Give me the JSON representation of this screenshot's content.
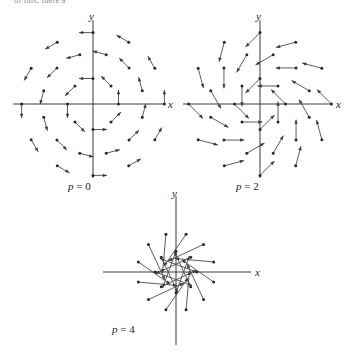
{
  "figure": {
    "clipped_top_text": "of this, there a",
    "background_color": "#ffffff",
    "ink_color": "#3a3a3a",
    "panels": [
      {
        "id": "panel-p0",
        "caption": "p = 0",
        "caption_param": "p",
        "caption_value": "0",
        "x_axis_label": "x",
        "y_axis_label": "y"
      },
      {
        "id": "panel-p2",
        "caption": "p = 2",
        "caption_param": "p",
        "caption_value": "2",
        "x_axis_label": "x",
        "y_axis_label": "y"
      },
      {
        "id": "panel-p4",
        "caption": "p = 4",
        "caption_param": "p",
        "caption_value": "4",
        "x_axis_label": "x",
        "y_axis_label": "y"
      }
    ]
  },
  "chart_data": {
    "type": "scatter",
    "title": "",
    "subtitle": "",
    "xlabel": "x",
    "ylabel": "y",
    "grid": false,
    "legend": "none",
    "panels": [
      {
        "name": "p = 0",
        "parameter": "p",
        "parameter_value": 0,
        "xlim": [
          -3,
          3
        ],
        "ylim": [
          -3,
          3
        ],
        "vector_scale": 0.55,
        "field_rotation_deg": 90,
        "rings": [
          {
            "radius": 1.0,
            "count": 8,
            "phase_deg": 0
          },
          {
            "radius": 2.0,
            "count": 12,
            "phase_deg": 15
          },
          {
            "radius": 2.8,
            "count": 12,
            "phase_deg": 0
          }
        ]
      },
      {
        "name": "p = 2",
        "parameter": "p",
        "parameter_value": 2,
        "xlim": [
          -3,
          3
        ],
        "ylim": [
          -3,
          3
        ],
        "vector_scale": 0.8,
        "field_rotation_deg": 135,
        "rings": [
          {
            "radius": 1.0,
            "count": 8,
            "phase_deg": 0
          },
          {
            "radius": 2.0,
            "count": 12,
            "phase_deg": 15
          },
          {
            "radius": 2.8,
            "count": 12,
            "phase_deg": 0
          }
        ]
      },
      {
        "name": "p = 4",
        "parameter": "p",
        "parameter_value": 4,
        "xlim": [
          -3,
          3
        ],
        "ylim": [
          -3,
          3
        ],
        "vector_scale": 1.5,
        "field_rotation_deg": 160,
        "rings": [
          {
            "radius": 0.8,
            "count": 8,
            "phase_deg": 0
          },
          {
            "radius": 1.5,
            "count": 12,
            "phase_deg": 15
          }
        ]
      }
    ]
  }
}
